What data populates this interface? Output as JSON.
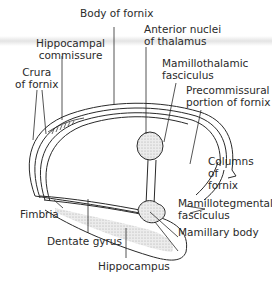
{
  "diagram": {
    "type": "anatomical illustration",
    "labels": {
      "body_of_fornix": "Body of fornix",
      "anterior_nuclei": [
        "Anterior nuclei",
        "of thalamus"
      ],
      "hippocampal_commissure": [
        "Hippocampal",
        "commissure"
      ],
      "mamillothalamic": [
        "Mamillothalamic",
        "fasciculus"
      ],
      "crura": [
        "Crura",
        "of fornix"
      ],
      "precommissural": [
        "Precommissural",
        "portion of fornix"
      ],
      "columns": [
        "Columns",
        "of",
        "fornix"
      ],
      "mamillotegmental": [
        "Mamillotegmental",
        "fasciculus"
      ],
      "fimbria": "Fimbria",
      "mamillary_body": "Mamillary body",
      "dentate_gyrus": "Dentate gyrus",
      "hippocampus": "Hippocampus"
    },
    "colors": {
      "line": "#2a2a2a",
      "stipple": "#d8d8d8",
      "background": "#ffffff"
    }
  }
}
